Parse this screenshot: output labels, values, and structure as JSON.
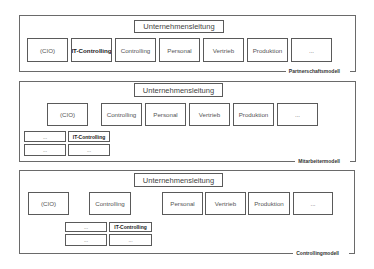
{
  "diagrams": [
    {
      "model_label": "Partnerschaftsmodell",
      "head": "Unternehmensleitung",
      "units": [
        "(CIO)",
        "IT-Controlling",
        "Controlling",
        "Personal",
        "Vertrieb",
        "Produktion",
        "..."
      ],
      "highlighted": "IT-Controlling"
    },
    {
      "model_label": "Mitarbeitermodell",
      "head": "Unternehmensleitung",
      "units": [
        "(CIO)",
        "Controlling",
        "Personal",
        "Vertrieb",
        "Produktion",
        "..."
      ],
      "sub_units": [
        "...",
        "IT-Controlling",
        "...",
        "..."
      ],
      "sub_parent": "(CIO)",
      "highlighted": "IT-Controlling"
    },
    {
      "model_label": "Controllingmodell",
      "head": "Unternehmensleitung",
      "units": [
        "(CIO)",
        "Controlling",
        "Personal",
        "Vertrieb",
        "Produktion",
        "..."
      ],
      "sub_units": [
        "...",
        "IT-Controlling",
        "...",
        "..."
      ],
      "sub_parent": "Controlling",
      "highlighted": "IT-Controlling"
    }
  ]
}
